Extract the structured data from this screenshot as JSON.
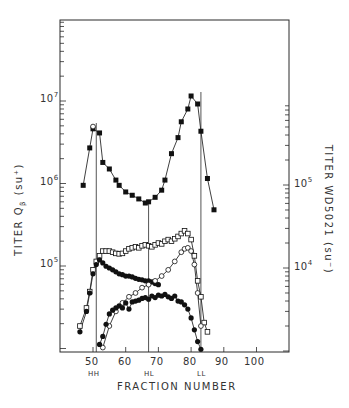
{
  "chart_data": {
    "type": "scatter",
    "title": "",
    "xlabel": "FRACTION NUMBER",
    "ylabel_left": "TITER Qβ (su⁺)",
    "ylabel_right": "TITER WD5021 (su⁻)",
    "x_ticks": [
      50,
      60,
      70,
      80,
      90,
      100
    ],
    "x_range": [
      40,
      104
    ],
    "y_left_ticks": [
      "10^5",
      "10^6",
      "10^7"
    ],
    "y_right_ticks": [
      "10^4",
      "10^5"
    ],
    "y_left_range_log10": [
      3.96,
      8.0
    ],
    "peak_markers": [
      {
        "label": "HH",
        "fraction": 51
      },
      {
        "label": "HL",
        "fraction": 67
      },
      {
        "label": "LL",
        "fraction": 83
      }
    ],
    "series": [
      {
        "name": "Qβ titer (filled squares)",
        "axis": "left",
        "marker": "filled-square",
        "x": [
          47,
          49,
          50,
          52,
          53,
          55,
          57,
          58,
          60,
          62,
          64,
          66,
          67,
          69,
          71,
          72,
          74,
          76,
          77,
          79,
          80,
          82,
          83,
          85,
          87
        ],
        "y": [
          950000,
          2700000,
          4600000,
          4100000,
          1800000,
          1500000,
          1100000,
          950000,
          790000,
          720000,
          650000,
          580000,
          600000,
          680000,
          830000,
          1100000,
          2300000,
          3600000,
          5600000,
          8000000,
          11500000,
          9200000,
          4300000,
          1150000,
          480000
        ]
      },
      {
        "name": "Qβ open circles (peak HH)",
        "axis": "left",
        "marker": "open-circle",
        "x": [
          50
        ],
        "y": [
          4900000
        ]
      },
      {
        "name": "WD5021 titer (open squares)",
        "axis": "right",
        "marker": "open-square",
        "x": [
          46,
          48,
          49,
          50,
          51,
          52,
          53,
          54,
          55,
          56,
          57,
          58,
          59,
          60,
          61,
          62,
          63,
          64,
          65,
          66,
          67,
          68,
          69,
          70,
          71,
          72,
          73,
          74,
          75,
          76,
          77,
          78,
          79,
          80,
          81,
          82,
          83,
          84,
          85
        ],
        "y": [
          2000,
          3300,
          5200,
          9500,
          12000,
          14000,
          16000,
          16000,
          16000,
          15500,
          15000,
          14800,
          15000,
          16000,
          17000,
          17500,
          18000,
          17500,
          18500,
          19000,
          18500,
          18000,
          19000,
          20000,
          19500,
          21000,
          22000,
          21000,
          22500,
          24000,
          26000,
          28000,
          26000,
          22000,
          14000,
          7000,
          4500,
          2200,
          1700
        ]
      },
      {
        "name": "filled circles (falling from HH)",
        "axis": "right",
        "marker": "filled-circle",
        "x": [
          46,
          48,
          49,
          50,
          51,
          52,
          53,
          54,
          55,
          56,
          57,
          58,
          59,
          60,
          61,
          62,
          63,
          64,
          65,
          66,
          67,
          68,
          69,
          70
        ],
        "y": [
          1700,
          3000,
          5000,
          8500,
          11000,
          12500,
          11500,
          10500,
          10000,
          9500,
          9000,
          8500,
          8300,
          8000,
          8000,
          7800,
          7500,
          7300,
          7200,
          7000,
          7000,
          6800,
          6500,
          6300
        ]
      },
      {
        "name": "open circles (rising to LL)",
        "axis": "right",
        "marker": "open-circle",
        "x": [
          53,
          55,
          57,
          59,
          61,
          63,
          65,
          67,
          69,
          71,
          73,
          75,
          77,
          78,
          79,
          80,
          81,
          82,
          83
        ],
        "y": [
          1100,
          2000,
          3000,
          3800,
          4500,
          5000,
          5800,
          6300,
          7000,
          8000,
          9500,
          12000,
          15500,
          17000,
          17500,
          16000,
          11000,
          5000,
          2000
        ]
      },
      {
        "name": "filled circles (HL hump)",
        "axis": "right",
        "marker": "filled-circle",
        "x": [
          52,
          53,
          54,
          55,
          56,
          57,
          58,
          59,
          60,
          61,
          62,
          63,
          64,
          65,
          66,
          67,
          68,
          69,
          70,
          71,
          72,
          73,
          74,
          75,
          76,
          77,
          78,
          79,
          80,
          81,
          82,
          83
        ],
        "y": [
          1200,
          1500,
          2100,
          2800,
          3100,
          3300,
          3500,
          3300,
          3800,
          3200,
          3900,
          4000,
          4100,
          4300,
          4400,
          4200,
          4600,
          4400,
          4700,
          4600,
          4800,
          4500,
          4300,
          4600,
          4000,
          3900,
          3600,
          3200,
          2500,
          1800,
          1300,
          1050
        ]
      }
    ]
  },
  "axes": {
    "x_title": "FRACTION NUMBER",
    "y_left_title": "TITER Q",
    "y_left_sub": "β",
    "y_left_unit": "(su⁺)",
    "y_right_title": "TITER WD5021 (su⁻)",
    "x_tick_labels": [
      "50",
      "60",
      "70",
      "80",
      "90",
      "100"
    ],
    "y_left_labels": [
      {
        "base": "10",
        "exp": "7"
      },
      {
        "base": "10",
        "exp": "6"
      },
      {
        "base": "10",
        "exp": "5"
      }
    ],
    "y_right_labels": [
      {
        "base": "10",
        "exp": "5"
      },
      {
        "base": "10",
        "exp": "4"
      }
    ],
    "peak_labels": [
      "HH",
      "HL",
      "LL"
    ]
  }
}
